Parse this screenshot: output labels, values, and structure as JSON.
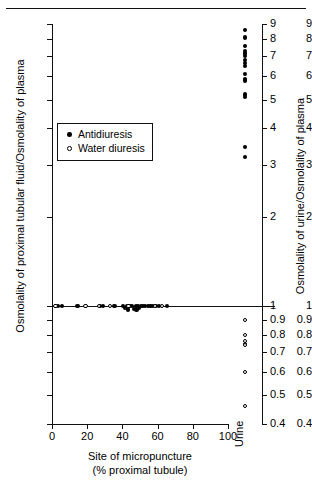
{
  "chart_data": {
    "type": "scatter",
    "title": "",
    "xlabel": "Site of micropuncture",
    "xlabel_line2": "(% proximal tubule)",
    "ylabel_left": "Osmolality of proximal tubular fluid/Osmolality of plasma",
    "ylabel_right": "Osmolality of urine/Osmolality of plasma",
    "yscale": "log",
    "ylim": [
      0.4,
      9
    ],
    "xlim": [
      0,
      100
    ],
    "grid": false,
    "legend_position": "inner-left",
    "y_ticks": [
      0.4,
      0.5,
      0.6,
      0.7,
      0.8,
      0.9,
      1,
      2,
      3,
      4,
      5,
      6,
      7,
      8,
      9
    ],
    "y_tick_labels": [
      "0.4",
      "0.5",
      "0.6",
      "0.7",
      "0.8",
      "0.9",
      "1",
      "2",
      "3",
      "4",
      "5",
      "6",
      "7",
      "8",
      "9"
    ],
    "x_ticks": [
      0,
      20,
      40,
      60,
      80,
      100
    ],
    "x_tick_labels": [
      "0",
      "20",
      "40",
      "60",
      "80",
      "100"
    ],
    "unity_reference_line": 1.0,
    "urine_panel_label": "Urine",
    "legend": [
      {
        "label": "Antidiuresis",
        "marker": "filled-circle"
      },
      {
        "label": "Water diuresis",
        "marker": "open-circle"
      }
    ],
    "series": [
      {
        "name": "Antidiuresis",
        "marker": "filled-circle",
        "panel": "micropuncture",
        "points": [
          {
            "x": 3.5,
            "y": 1.0
          },
          {
            "x": 5.5,
            "y": 1.0
          },
          {
            "x": 14.5,
            "y": 1.0
          },
          {
            "x": 27.5,
            "y": 1.0
          },
          {
            "x": 29.0,
            "y": 1.0
          },
          {
            "x": 35.5,
            "y": 1.0
          },
          {
            "x": 40.5,
            "y": 1.0
          },
          {
            "x": 41.5,
            "y": 0.985
          },
          {
            "x": 42.5,
            "y": 1.0
          },
          {
            "x": 43.0,
            "y": 0.975
          },
          {
            "x": 44.0,
            "y": 1.0
          },
          {
            "x": 45.5,
            "y": 1.0
          },
          {
            "x": 46.5,
            "y": 0.98
          },
          {
            "x": 47.5,
            "y": 1.0
          },
          {
            "x": 48.0,
            "y": 0.975
          },
          {
            "x": 48.8,
            "y": 1.0
          },
          {
            "x": 49.5,
            "y": 0.985
          },
          {
            "x": 50.5,
            "y": 1.0
          },
          {
            "x": 51.5,
            "y": 1.0
          },
          {
            "x": 53.0,
            "y": 1.0
          },
          {
            "x": 54.5,
            "y": 1.0
          },
          {
            "x": 56.0,
            "y": 1.0
          },
          {
            "x": 57.5,
            "y": 1.0
          },
          {
            "x": 59.0,
            "y": 1.0
          },
          {
            "x": 61.0,
            "y": 1.0
          },
          {
            "x": 65.5,
            "y": 1.0
          }
        ]
      },
      {
        "name": "Water diuresis",
        "marker": "open-circle",
        "panel": "micropuncture",
        "points": [
          {
            "x": 2.0,
            "y": 1.0
          },
          {
            "x": 19.0,
            "y": 1.0
          },
          {
            "x": 26.5,
            "y": 1.0
          },
          {
            "x": 33.0,
            "y": 1.0
          },
          {
            "x": 43.5,
            "y": 1.0
          },
          {
            "x": 58.5,
            "y": 1.0
          },
          {
            "x": 62.5,
            "y": 1.0
          }
        ]
      },
      {
        "name": "Antidiuresis",
        "marker": "filled-circle",
        "panel": "urine",
        "points": [
          {
            "y": 8.6
          },
          {
            "y": 8.1
          },
          {
            "y": 7.6
          },
          {
            "y": 7.3
          },
          {
            "y": 7.15
          },
          {
            "y": 7.0
          },
          {
            "y": 6.8
          },
          {
            "y": 6.65
          },
          {
            "y": 6.5
          },
          {
            "y": 6.1
          },
          {
            "y": 5.85
          },
          {
            "y": 5.8
          },
          {
            "y": 5.2
          },
          {
            "y": 5.1
          },
          {
            "y": 3.45
          },
          {
            "y": 3.2
          }
        ]
      },
      {
        "name": "Water diuresis",
        "marker": "open-circle",
        "panel": "urine",
        "points": [
          {
            "y": 0.9
          },
          {
            "y": 0.8
          },
          {
            "y": 0.765
          },
          {
            "y": 0.745
          },
          {
            "y": 0.74
          },
          {
            "y": 0.6
          },
          {
            "y": 0.46
          }
        ]
      }
    ]
  }
}
